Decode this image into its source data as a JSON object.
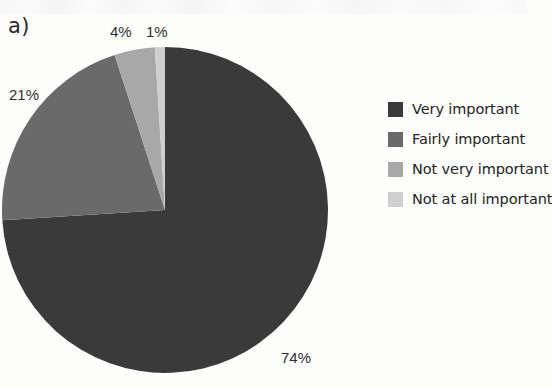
{
  "figure": {
    "panel_label": "a)",
    "background_color": "#fdfdfc"
  },
  "chart_data": {
    "type": "pie",
    "title": "",
    "subtitle": "",
    "xlabel": "",
    "ylabel": "",
    "grid": false,
    "legend_position": "right",
    "start_angle_deg": 0,
    "direction": "clockwise",
    "units": "percent",
    "categories": [
      "Very important",
      "Fairly important",
      "Not very important",
      "Not at all important"
    ],
    "values": [
      74,
      21,
      4,
      1
    ],
    "data_labels": [
      "74%",
      "21%",
      "4%",
      "1%"
    ],
    "colors": [
      "#3a3a3a",
      "#6a6a6a",
      "#a8a8a8",
      "#cfcfcf"
    ],
    "slices": [
      {
        "label": "Very important",
        "value": 74,
        "data_label": "74%",
        "color": "#3a3a3a"
      },
      {
        "label": "Fairly important",
        "value": 21,
        "data_label": "21%",
        "color": "#6a6a6a"
      },
      {
        "label": "Not very important",
        "value": 4,
        "data_label": "4%",
        "color": "#a8a8a8"
      },
      {
        "label": "Not at all important",
        "value": 1,
        "data_label": "1%",
        "color": "#cfcfcf"
      }
    ]
  },
  "legend": {
    "items": [
      {
        "label": "Very important",
        "color": "#3a3a3a"
      },
      {
        "label": "Fairly important",
        "color": "#6a6a6a"
      },
      {
        "label": "Not very important",
        "color": "#a8a8a8"
      },
      {
        "label": "Not at all important",
        "color": "#cfcfcf"
      }
    ]
  }
}
